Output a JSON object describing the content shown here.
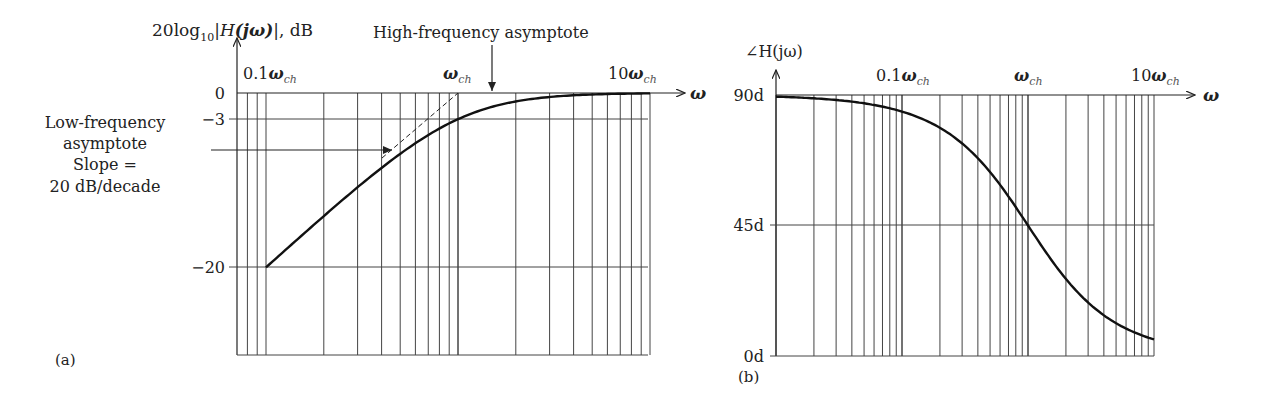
{
  "chart_data": [
    {
      "type": "line",
      "panel": "(a)",
      "title": "",
      "ylabel": "20log10|H(jω)|, dB",
      "xlabel": "ω",
      "xscale": "log",
      "x_tick_labels": [
        "0.1ωch",
        "ωch",
        "10ωch"
      ],
      "y_tick_labels": [
        "0",
        "−3",
        "−20"
      ],
      "y_ticks": [
        0,
        -3,
        -20
      ],
      "xlim_decades": [
        -1.3,
        1
      ],
      "ylim": [
        -30,
        0
      ],
      "grid": true,
      "series": [
        {
          "name": "Magnitude (high-pass, first order)",
          "x_rel_wch": [
            0.1,
            0.2,
            0.3,
            0.5,
            0.7,
            1,
            1.5,
            2,
            3,
            5,
            10
          ],
          "values": [
            -20.0,
            -14.0,
            -10.8,
            -7.0,
            -4.8,
            -3.0,
            -1.6,
            -1.0,
            -0.46,
            -0.17,
            -0.04
          ]
        },
        {
          "name": "Low-frequency asymptote (dashed)",
          "x_rel_wch": [
            0.35,
            1
          ],
          "values": [
            -9.1,
            0
          ]
        }
      ],
      "annotations": [
        "High-frequency asymptote",
        "Low-frequency asymptote",
        "Slope =",
        "20 dB/decade"
      ]
    },
    {
      "type": "line",
      "panel": "(b)",
      "title": "",
      "ylabel": "∠H(jω)",
      "xlabel": "ω",
      "xscale": "log",
      "x_tick_labels": [
        "0.1ωch",
        "ωch",
        "10ωch"
      ],
      "y_tick_labels": [
        "90d",
        "45d",
        "0d"
      ],
      "y_ticks": [
        90,
        45,
        0
      ],
      "xlim_decades": [
        -2,
        1
      ],
      "ylim": [
        0,
        90
      ],
      "grid": true,
      "series": [
        {
          "name": "Phase",
          "x_rel_wch": [
            0.01,
            0.03,
            0.1,
            0.2,
            0.3,
            0.5,
            0.7,
            1,
            2,
            3,
            5,
            10
          ],
          "values": [
            89.4,
            88.3,
            84.3,
            78.7,
            73.3,
            63.4,
            55.0,
            45.0,
            26.6,
            18.4,
            11.3,
            5.7
          ]
        }
      ]
    }
  ],
  "left": {
    "ylabel_prefix": "20log",
    "ylabel_sub": "10",
    "ylabel_mid": "|",
    "ylabel_H": "H",
    "ylabel_paren": "(jω)",
    "ylabel_suffix": "|, dB",
    "xtick_01_num": "0.1",
    "xtick_1_num": "",
    "xtick_10_num": "10",
    "omega": "ω",
    "ch": "ch",
    "y0": "0",
    "y3": "−3",
    "y20": "−20",
    "hf_label": "High-frequency asymptote",
    "lf_line1": "Low-frequency",
    "lf_line2": "asymptote",
    "lf_line3": "Slope =",
    "lf_line4": "20 dB/decade",
    "panel": "(a)"
  },
  "right": {
    "ylabel": "∠H(jω)",
    "xtick_01_num": "0.1",
    "xtick_10_num": "10",
    "omega": "ω",
    "ch": "ch",
    "y90": "90d",
    "y45": "45d",
    "y0": "0d",
    "panel": "(b)"
  }
}
